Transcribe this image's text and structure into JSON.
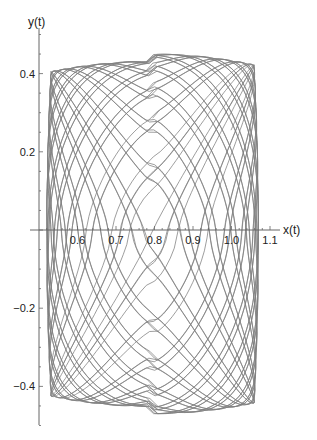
{
  "chart_data": {
    "type": "line",
    "subtype": "parametric",
    "title": "",
    "xlabel": "x(t)",
    "ylabel": "y(t)",
    "x_ticks": [
      0.6,
      0.7,
      0.8,
      0.9,
      1.0,
      1.1
    ],
    "x_tick_labels": [
      "0.6",
      "0.7",
      "0.8",
      "0.9",
      "1.0",
      "1.1"
    ],
    "y_ticks": [
      -0.4,
      -0.2,
      0.2,
      0.4
    ],
    "y_tick_labels": [
      "-0.4",
      "-0.2",
      "0.2",
      "0.4"
    ],
    "xlim": [
      0.5,
      1.13
    ],
    "ylim": [
      -0.53,
      0.52
    ],
    "axis_origin": {
      "x": 0.5,
      "y": 0
    },
    "grid": false,
    "legend": null,
    "series": [
      {
        "name": "trajectory",
        "color": "#808080",
        "x_range": [
          0.52,
          1.07
        ],
        "y_range": [
          -0.47,
          0.45
        ],
        "description": "quasi-periodic trajectory densely filling a rounded box region"
      }
    ]
  },
  "colors": {
    "curve": "#808080",
    "axis": "#666666",
    "background": "#ffffff"
  }
}
